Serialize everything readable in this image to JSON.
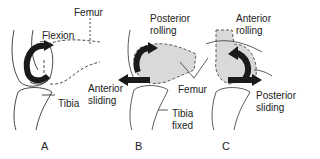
{
  "figure": {
    "panels": [
      {
        "id": "A",
        "label": "A",
        "labels": {
          "femur": "Femur",
          "motion": "Flexion",
          "tibia": "Tibia"
        }
      },
      {
        "id": "B",
        "label": "B",
        "labels": {
          "rolling_1": "Posterior",
          "rolling_2": "rolling",
          "sliding_1": "Anterior",
          "sliding_2": "sliding",
          "femur": "Femur",
          "tibia_1": "Tibia",
          "tibia_2": "fixed"
        }
      },
      {
        "id": "C",
        "label": "C",
        "labels": {
          "rolling_1": "Anterior",
          "rolling_2": "rolling",
          "sliding_1": "Posterior",
          "sliding_2": "sliding"
        }
      }
    ],
    "colors": {
      "line": "#222222",
      "arrow": "#1a1a1a",
      "shading": "#d9d9d9"
    }
  }
}
